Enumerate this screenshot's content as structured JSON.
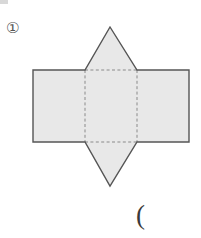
{
  "page": {
    "width": 201,
    "height": 238,
    "background_color": "#ffffff"
  },
  "item_number": {
    "label": "①",
    "icon_name": "circled-one-marker"
  },
  "answer_slot": {
    "label": "(",
    "icon_name": "open-parenthesis"
  },
  "artifact": {
    "label": "",
    "color": "#d8d8d8"
  },
  "figure": {
    "fill_color": "#e8e8e8",
    "stroke_color": "#555555",
    "dashed_color": "#8a8a8a",
    "stroke_width": 1.4,
    "parts": [
      {
        "name": "left-face-rectangle",
        "shape": "rectangle",
        "points": "33,70 85,70 85,142 33,142"
      },
      {
        "name": "center-face-square",
        "shape": "square",
        "points": "85,70 137,70 137,142 85,142"
      },
      {
        "name": "right-face-rectangle",
        "shape": "rectangle",
        "points": "137,70 189,70 189,142 137,142"
      },
      {
        "name": "top-face-triangle",
        "shape": "triangle",
        "points": "85,70 110,27 137,70"
      },
      {
        "name": "bottom-face-triangle",
        "shape": "triangle",
        "points": "85,142 110,186 137,142"
      }
    ],
    "fold_lines": [
      {
        "name": "fold-line-left",
        "points": "85,70 85,142"
      },
      {
        "name": "fold-line-right",
        "points": "137,70 137,142"
      },
      {
        "name": "fold-line-top",
        "points": "85,70 137,70"
      },
      {
        "name": "fold-line-bottom",
        "points": "85,142 137,142"
      }
    ],
    "outline": "33,70 85,70 110,27 137,70 189,70 189,142 137,142 110,186 85,142 33,142"
  }
}
